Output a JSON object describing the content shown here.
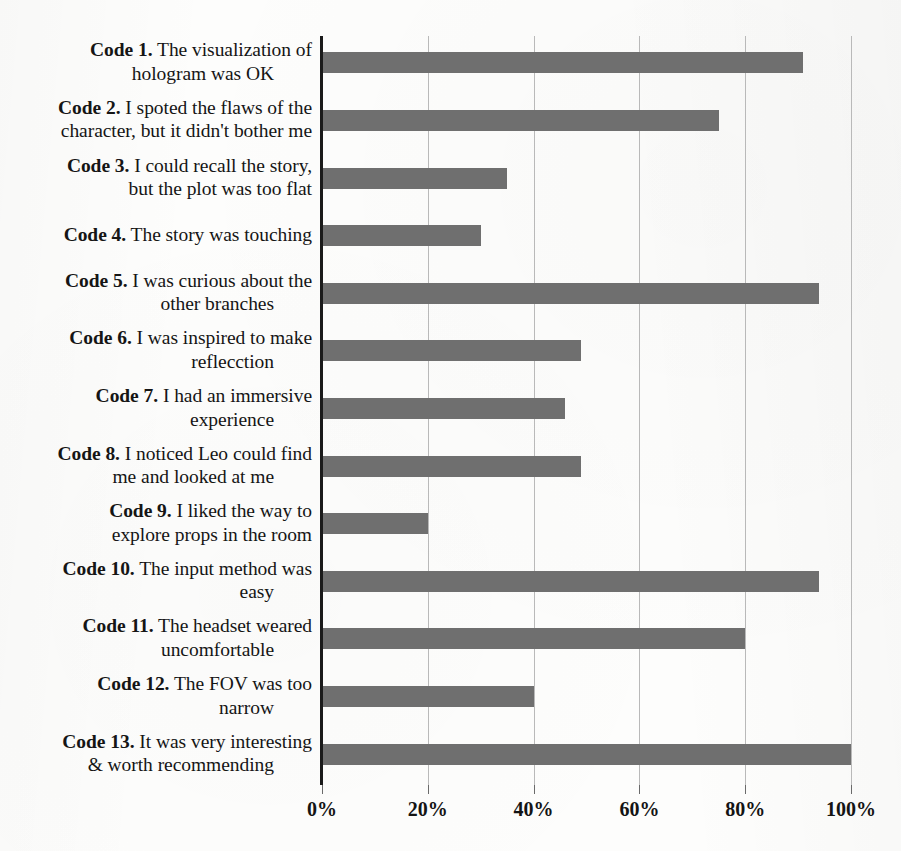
{
  "chart_data": {
    "type": "bar",
    "orientation": "horizontal",
    "title": "",
    "xlabel": "",
    "ylabel": "",
    "xlim": [
      0,
      100
    ],
    "xtick_labels": [
      "0%",
      "20%",
      "40%",
      "60%",
      "80%",
      "100%"
    ],
    "xticks": [
      0,
      20,
      40,
      60,
      80,
      100
    ],
    "grid": true,
    "legend": false,
    "bar_color": "#6f6f6f",
    "axis_color": "#1a1a1a",
    "gridline_color": "#b9b9b9",
    "categories": [
      "Code 1. The visualization of hologram was OK",
      "Code 2. I spoted the flaws of the character,  but it didn't bother me",
      "Code 3. I could recall the story, but the plot was too flat",
      "Code 4. The story was touching",
      "Code 5. I was curious about the other branches",
      "Code 6. I was inspired to make reflecction",
      "Code 7. I had an immersive experience",
      "Code 8. I noticed Leo could find me and looked at me",
      "Code 9. I  liked the way to explore props in the room",
      "Code 10. The input method was easy",
      "Code 11. The headset weared uncomfortable",
      "Code 12. The FOV was too narrow",
      "Code 13. It was very interesting & worth recommending"
    ],
    "values": [
      91,
      75,
      35,
      30,
      94,
      49,
      46,
      49,
      20,
      94,
      80,
      40,
      100
    ]
  },
  "labels": [
    {
      "key": "Code 1.",
      "text": " The visualization of",
      "text2": "hologram was OK",
      "align2": "center"
    },
    {
      "key": "Code 2.",
      "text": " I spoted the flaws of the",
      "text2": "character,  but it didn't bother me",
      "align2": "right"
    },
    {
      "key": "Code 3.",
      "text": " I could recall the story,",
      "text2": "but the plot was too flat",
      "align2": "right"
    },
    {
      "key": "Code 4.",
      "text": " The story was touching",
      "text2": "",
      "align2": "right"
    },
    {
      "key": "Code 5.",
      "text": " I was curious about the",
      "text2": "other branches",
      "align2": "center"
    },
    {
      "key": "Code 6.",
      "text": " I was inspired to make",
      "text2": "reflecction",
      "align2": "center"
    },
    {
      "key": "Code 7.",
      "text": " I had an immersive",
      "text2": "experience",
      "align2": "center"
    },
    {
      "key": "Code 8.",
      "text": " I noticed Leo could find",
      "text2": "me and looked at me",
      "align2": "center"
    },
    {
      "key": "Code 9.",
      "text": " I  liked the way to",
      "text2": "explore props in the room",
      "align2": "right"
    },
    {
      "key": "Code 10.",
      "text": " The input method was",
      "text2": "easy",
      "align2": "center"
    },
    {
      "key": "Code 11.",
      "text": " The headset weared",
      "text2": "uncomfortable",
      "align2": "center"
    },
    {
      "key": "Code 12.",
      "text": " The FOV was too",
      "text2": "narrow",
      "align2": "center"
    },
    {
      "key": "Code 13.",
      "text": " It was very interesting",
      "text2": "& worth recommending",
      "align2": "center"
    }
  ]
}
